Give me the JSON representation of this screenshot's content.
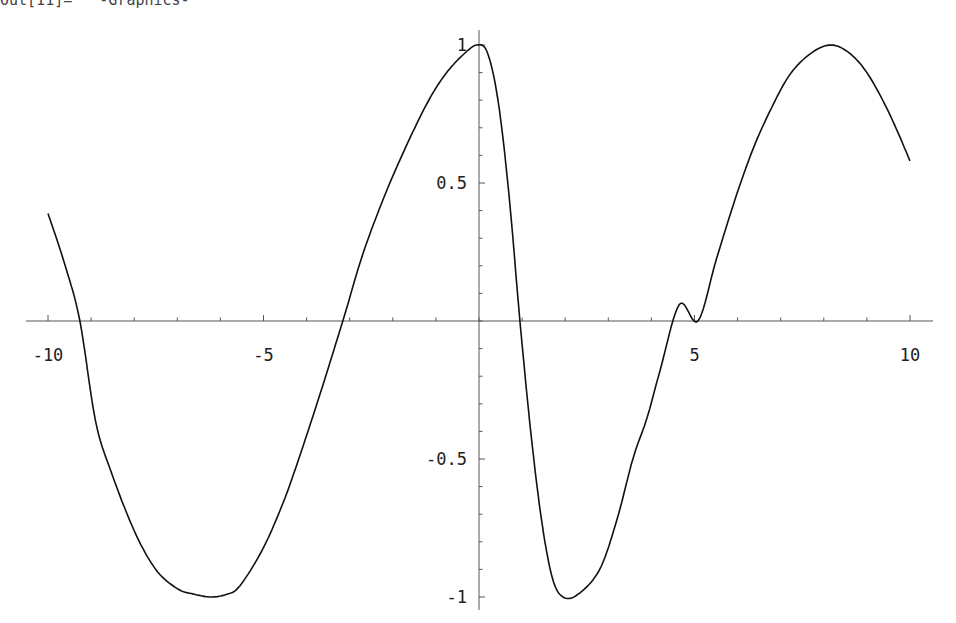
{
  "header": {
    "clipped_output_line": "Out[11]=   -Graphics-"
  },
  "chart_data": {
    "type": "line",
    "title": "",
    "xlabel": "",
    "ylabel": "",
    "xlim": [
      -10,
      10
    ],
    "ylim": [
      -1,
      1
    ],
    "grid": false,
    "legend": null,
    "x_ticks": [
      -10,
      -5,
      5,
      10
    ],
    "x_tick_labels": [
      "-10",
      "-5",
      "5",
      "10"
    ],
    "y_ticks": [
      1,
      0.5,
      -0.5,
      -1
    ],
    "y_tick_labels": [
      "1",
      "0.5",
      "-0.5",
      "-1"
    ],
    "x_minor_step": 1,
    "y_minor_step": 0.1,
    "series": [
      {
        "name": "f(x)",
        "color": "#111111",
        "x": [
          -10,
          -9.6,
          -9.26,
          -8.9,
          -8.55,
          -8.0,
          -7.5,
          -7.0,
          -6.6,
          -6.22,
          -5.85,
          -5.55,
          -5.03,
          -4.6,
          -4.27,
          -3.74,
          -3.16,
          -2.7,
          -2.2,
          -1.7,
          -1.2,
          -0.8,
          -0.4,
          -0.05,
          0.2,
          0.45,
          0.7,
          0.95,
          1.2,
          1.45,
          1.7,
          1.95,
          2.3,
          2.8,
          3.2,
          3.57,
          3.9,
          4.2,
          4.65,
          5.08,
          5.5,
          5.94,
          6.35,
          6.75,
          7.2,
          7.7,
          8.17,
          8.6,
          9.0,
          9.4,
          9.7,
          10.0
        ],
        "y": [
          0.39,
          0.2,
          0.0,
          -0.36,
          -0.54,
          -0.76,
          -0.9,
          -0.97,
          -0.99,
          -1.0,
          -0.99,
          -0.96,
          -0.83,
          -0.68,
          -0.54,
          -0.29,
          0.0,
          0.24,
          0.45,
          0.63,
          0.79,
          0.89,
          0.96,
          1.0,
          0.97,
          0.79,
          0.45,
          0.0,
          -0.4,
          -0.72,
          -0.93,
          -1.0,
          -0.99,
          -0.9,
          -0.72,
          -0.5,
          -0.35,
          -0.18,
          0.06,
          0.0,
          0.22,
          0.44,
          0.62,
          0.76,
          0.89,
          0.97,
          1.0,
          0.97,
          0.9,
          0.79,
          0.69,
          0.58
        ]
      }
    ]
  }
}
